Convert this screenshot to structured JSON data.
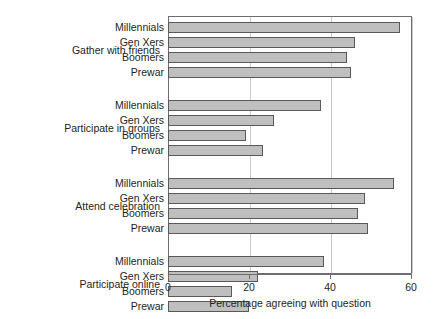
{
  "chart_data": {
    "type": "bar",
    "orientation": "horizontal",
    "title": "",
    "xlabel": "Percentage agreeing with question",
    "ylabel": "",
    "xlim": [
      0,
      60
    ],
    "xticks": [
      0,
      20,
      40,
      60
    ],
    "xtick_labels": [
      "0",
      "20",
      "40",
      "60"
    ],
    "grid": "vertical",
    "legend": "none",
    "bar_color": "#bfbfbf",
    "bar_edge_color": "#58595b",
    "groups": [
      {
        "label": "Gather with friends",
        "categories": [
          "Millennials",
          "Gen Xers",
          "Boomers",
          "Prewar"
        ],
        "values": [
          57.3,
          46.2,
          44.2,
          45.2
        ]
      },
      {
        "label": "Participate in groups",
        "categories": [
          "Millennials",
          "Gen Xers",
          "Boomers",
          "Prewar"
        ],
        "values": [
          37.9,
          26.2,
          19.3,
          23.4
        ]
      },
      {
        "label": "Attend celebration",
        "categories": [
          "Millennials",
          "Gen Xers",
          "Boomers",
          "Prewar"
        ],
        "values": [
          55.8,
          48.6,
          46.9,
          49.4
        ]
      },
      {
        "label": "Participate online",
        "categories": [
          "Millennials",
          "Gen Xers",
          "Boomers",
          "Prewar"
        ],
        "values": [
          38.4,
          22.2,
          15.8,
          19.9
        ]
      }
    ]
  }
}
